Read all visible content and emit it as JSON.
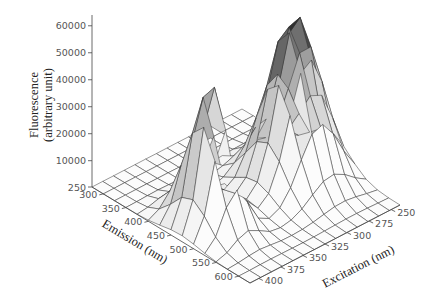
{
  "chart_data": {
    "type": "surface3d",
    "title": "",
    "zlabel_line1": "Fluorescence",
    "zlabel_line2": "(arbitrary unit)",
    "xlabel": "Emission (nm)",
    "ylabel": "Excitation (nm)",
    "z_ticks": [
      "60000",
      "50000",
      "40000",
      "30000",
      "20000",
      "10000",
      "250"
    ],
    "z_tick_values": [
      60000,
      50000,
      40000,
      30000,
      20000,
      10000,
      250
    ],
    "emission_ticks": [
      "300",
      "350",
      "400",
      "450",
      "500",
      "550",
      "600"
    ],
    "excitation_ticks": [
      "250",
      "275",
      "300",
      "325",
      "350",
      "375",
      "400"
    ],
    "zlim": [
      250,
      64000
    ],
    "emission_range": [
      275,
      625
    ],
    "excitation_range": [
      240,
      410
    ],
    "grid": true,
    "peaks": [
      {
        "emission_nm": 470,
        "excitation_nm": 375,
        "fluorescence": 52000
      },
      {
        "emission_nm": 470,
        "excitation_nm": 280,
        "fluorescence": 62000
      }
    ]
  }
}
